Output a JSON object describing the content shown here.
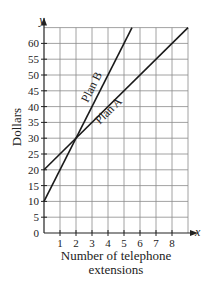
{
  "chart_data": {
    "type": "line",
    "title": "",
    "xlabel": "Number of telephone extensions",
    "xlabel_lines": [
      "Number of telephone",
      "extensions"
    ],
    "ylabel": "Dollars",
    "x_axis_var": "x",
    "y_axis_var": "y",
    "xlim": [
      0,
      9
    ],
    "ylim": [
      0,
      65
    ],
    "x_ticks": [
      1,
      2,
      3,
      4,
      5,
      6,
      7,
      8
    ],
    "y_ticks": [
      0,
      5,
      10,
      15,
      20,
      25,
      30,
      35,
      40,
      45,
      50,
      55,
      60
    ],
    "grid": true,
    "legend": "inline labels on lines",
    "series": [
      {
        "name": "Plan A",
        "equation": "y = 5x + 20",
        "x": [
          0,
          9
        ],
        "values": [
          20,
          65
        ]
      },
      {
        "name": "Plan B",
        "equation": "y = 10x + 10",
        "x": [
          0,
          5.5
        ],
        "values": [
          10,
          65
        ]
      }
    ],
    "intersection": {
      "x": 2,
      "y": 30
    }
  }
}
